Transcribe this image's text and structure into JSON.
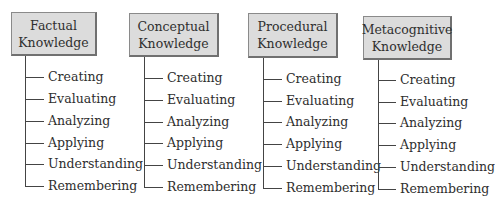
{
  "diagram": {
    "type": "taxonomy-tree",
    "columns": [
      {
        "title_line1": "Factual",
        "title_line2": "Knowledge",
        "items": [
          "Creating",
          "Evaluating",
          "Analyzing",
          "Applying",
          "Understanding",
          "Remembering"
        ]
      },
      {
        "title_line1": "Conceptual",
        "title_line2": "Knowledge",
        "items": [
          "Creating",
          "Evaluating",
          "Analyzing",
          "Applying",
          "Understanding",
          "Remembering"
        ]
      },
      {
        "title_line1": "Procedural",
        "title_line2": "Knowledge",
        "items": [
          "Creating",
          "Evaluating",
          "Analyzing",
          "Applying",
          "Understanding",
          "Remembering"
        ]
      },
      {
        "title_line1": "Metacognitive",
        "title_line2": "Knowledge",
        "items": [
          "Creating",
          "Evaluating",
          "Analyzing",
          "Applying",
          "Understanding",
          "Remembering"
        ]
      }
    ],
    "colors": {
      "box_fill": "#dcdcdc",
      "box_border": "#707070",
      "line": "#444444",
      "text": "#2e2e2e"
    }
  }
}
